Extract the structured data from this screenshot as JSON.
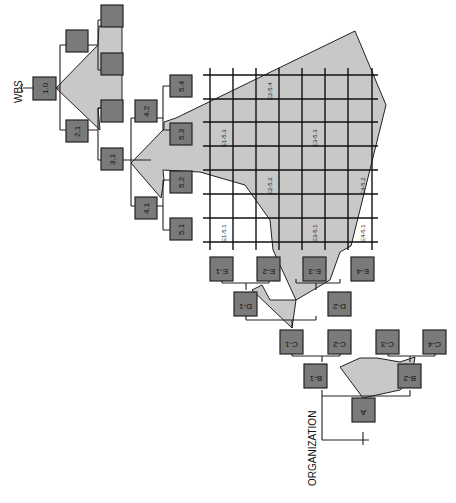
{
  "diagram": {
    "labels": {
      "wbs": "WBS",
      "organization": "ORGANIZATION"
    },
    "colors": {
      "node_fill": "#7a7a7a",
      "shade_fill": "#c8c8c8",
      "line": "#222222",
      "background": "#ffffff"
    },
    "wbs_nodes": [
      {
        "id": "1.0",
        "label": "1.0"
      },
      {
        "id": "2.1",
        "label": "2.1"
      },
      {
        "id": "2.2",
        "label": ""
      },
      {
        "id": "3.1",
        "label": "3.1"
      },
      {
        "id": "3.2",
        "label": ""
      },
      {
        "id": "3.3",
        "label": ""
      },
      {
        "id": "3.4",
        "label": ""
      },
      {
        "id": "4.1",
        "label": "4.1"
      },
      {
        "id": "4.2",
        "label": "4.2"
      },
      {
        "id": "5.1",
        "label": "5.1"
      },
      {
        "id": "5.2",
        "label": "5.2"
      },
      {
        "id": "5.3",
        "label": "5.3"
      },
      {
        "id": "5.4",
        "label": "5.4"
      }
    ],
    "org_nodes": [
      {
        "id": "A",
        "label": "A"
      },
      {
        "id": "B-1",
        "label": "B-1"
      },
      {
        "id": "B-2",
        "label": "B-2"
      },
      {
        "id": "C-1",
        "label": "C-1"
      },
      {
        "id": "C-2",
        "label": "C-2"
      },
      {
        "id": "C-3",
        "label": "C-3"
      },
      {
        "id": "C-4",
        "label": "C-4"
      },
      {
        "id": "D-1",
        "label": "D-1"
      },
      {
        "id": "D-2",
        "label": "D-2"
      },
      {
        "id": "E-1",
        "label": "E-1"
      },
      {
        "id": "E-2",
        "label": "E-2"
      },
      {
        "id": "E-3",
        "label": "E-3"
      },
      {
        "id": "E-4",
        "label": "E-4"
      }
    ],
    "matrix_cells": [
      {
        "label": "E1-5.3"
      },
      {
        "label": "E2-5.4"
      },
      {
        "label": "E3-5.3"
      },
      {
        "label": "E2-5.2"
      },
      {
        "label": "E4-5.2"
      },
      {
        "label": "E1-5.1"
      },
      {
        "label": "E3-5.1"
      },
      {
        "label": "E4-5.1"
      }
    ]
  }
}
